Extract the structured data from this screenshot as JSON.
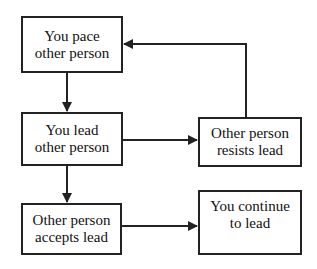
{
  "diagram": {
    "nodes": [
      {
        "id": "pace",
        "label": "You pace\nother person"
      },
      {
        "id": "lead",
        "label": "You lead\nother person"
      },
      {
        "id": "resists",
        "label": "Other person\nresists lead"
      },
      {
        "id": "accepts",
        "label": "Other person\naccepts lead"
      },
      {
        "id": "continue",
        "label": "You continue\nto lead"
      }
    ],
    "edges": [
      {
        "from": "pace",
        "to": "lead"
      },
      {
        "from": "lead",
        "to": "resists"
      },
      {
        "from": "resists",
        "to": "pace"
      },
      {
        "from": "lead",
        "to": "accepts"
      },
      {
        "from": "accepts",
        "to": "continue"
      }
    ],
    "colors": {
      "line": "#222222",
      "background": "#ffffff"
    }
  }
}
